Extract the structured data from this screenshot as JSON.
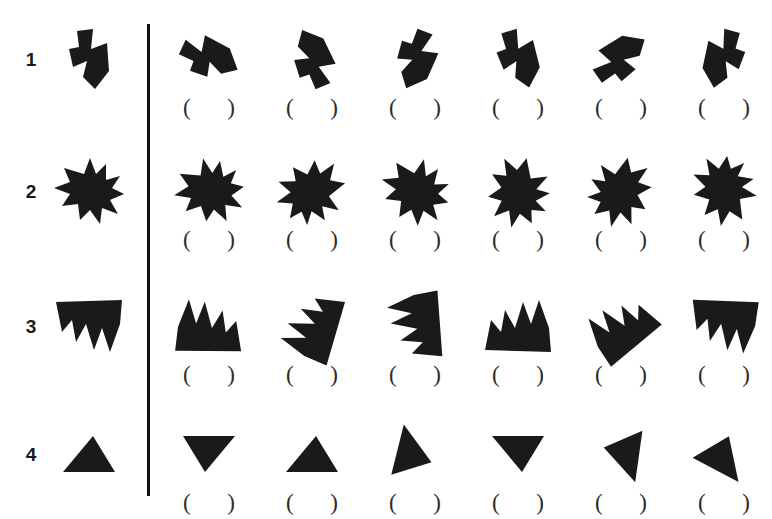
{
  "sheet": {
    "title": "Mental rotation worksheet",
    "background_color": "#ffffff",
    "ink_color": "#1a1a1a",
    "divider": {
      "name": "vertical-rule",
      "x": 147,
      "y": 24,
      "height": 472
    }
  },
  "answer_slot": {
    "left_paren": "(",
    "right_paren": ")"
  },
  "rows": [
    {
      "number": "1",
      "reference": {
        "name": "reference-figure-row-1",
        "description": "zigzag arrow-like polygon",
        "points": "30,4 46,2 44,22 60,16 62,44 48,62 36,50 40,34 26,40 22,22 32,20",
        "rotate": 0,
        "flip": false
      },
      "options": [
        {
          "label": "1A",
          "rotate": -58,
          "flip": false
        },
        {
          "label": "1B",
          "rotate": 150,
          "flip": true
        },
        {
          "label": "1C",
          "rotate": 28,
          "flip": false
        },
        {
          "label": "1D",
          "rotate": -10,
          "flip": false
        },
        {
          "label": "1E",
          "rotate": -118,
          "flip": false
        },
        {
          "label": "1F",
          "rotate": 8,
          "flip": true
        }
      ]
    },
    {
      "number": "2",
      "reference": {
        "name": "reference-figure-row-2",
        "description": "spiky star-like blob",
        "points": "36,18 42,2 48,18 58,8 58,24 72,20 64,32 76,38 62,44 70,58 54,52 52,68 42,54 32,64 30,48 14,50 22,38 6,32 22,26 16,12",
        "rotate": 0,
        "flip": false
      },
      "options": [
        {
          "label": "2A",
          "rotate": -12,
          "flip": false
        },
        {
          "label": "2B",
          "rotate": 124,
          "flip": false
        },
        {
          "label": "2C",
          "rotate": 14,
          "flip": false
        },
        {
          "label": "2D",
          "rotate": 62,
          "flip": false
        },
        {
          "label": "2E",
          "rotate": -36,
          "flip": true
        },
        {
          "label": "2F",
          "rotate": 100,
          "flip": true
        }
      ]
    },
    {
      "number": "3",
      "reference": {
        "name": "reference-figure-row-3",
        "description": "broad notched wedge with downward spikes",
        "points": "8,8 74,6 72,30 62,58 54,34 46,56 38,30 28,48 24,26 14,38",
        "rotate": 0,
        "flip": false
      },
      "options": [
        {
          "label": "3A",
          "rotate": 182,
          "flip": false
        },
        {
          "label": "3B",
          "rotate": 108,
          "flip": false
        },
        {
          "label": "3C",
          "rotate": 84,
          "flip": true
        },
        {
          "label": "3D",
          "rotate": 180,
          "flip": true
        },
        {
          "label": "3E",
          "rotate": 142,
          "flip": false
        },
        {
          "label": "3F",
          "rotate": 4,
          "flip": false
        }
      ]
    },
    {
      "number": "4",
      "reference": {
        "name": "reference-figure-row-4",
        "description": "plain scalene triangle",
        "points": "10,46 40,10 62,46",
        "rotate": 0,
        "flip": false
      },
      "options": [
        {
          "label": "4A",
          "rotate": 180,
          "flip": false
        },
        {
          "label": "4B",
          "rotate": 0,
          "flip": false
        },
        {
          "label": "4C",
          "rotate": 104,
          "flip": false
        },
        {
          "label": "4D",
          "rotate": 180,
          "flip": true
        },
        {
          "label": "4E",
          "rotate": -82,
          "flip": false
        },
        {
          "label": "4F",
          "rotate": 28,
          "flip": true
        }
      ]
    }
  ],
  "layout": {
    "row_tops": [
      20,
      152,
      287,
      415
    ],
    "column_lefts": [
      163,
      266,
      369,
      472,
      575,
      678
    ]
  }
}
